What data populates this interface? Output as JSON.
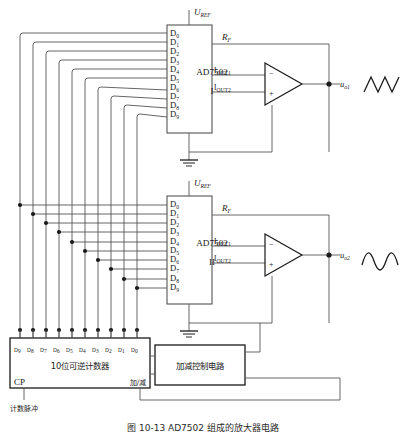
{
  "figure": {
    "caption": "图 10-13  AD7502 组成的放大器电路",
    "background": "#ffffff",
    "line_color": "#555555",
    "text_color": "#1a1a1a"
  },
  "dac1": {
    "chip_label": "AD7502",
    "unit_label": "I",
    "vref_label": "U",
    "vref_sub": "REF",
    "rf_label": "R",
    "rf_sub": "F",
    "iout1": "I",
    "iout1_sub": "OUT1",
    "iout2": "I",
    "iout2_sub": "OUT2",
    "data_pins": [
      "D0",
      "D1",
      "D2",
      "D3",
      "D4",
      "D5",
      "D6",
      "D7",
      "D8",
      "D9"
    ],
    "data_pin_base": "D",
    "data_pin_subs": [
      "0",
      "1",
      "2",
      "3",
      "4",
      "5",
      "6",
      "7",
      "8",
      "9"
    ],
    "output_label": "u",
    "output_sub": "o1",
    "output_waveform": "triangle",
    "opamp_minus": "−",
    "opamp_plus": "+"
  },
  "dac2": {
    "chip_label": "AD7502",
    "unit_label": "II",
    "vref_label": "U",
    "vref_sub": "REF",
    "rf_label": "R",
    "rf_sub": "F",
    "iout1": "I",
    "iout1_sub": "OUT1",
    "iout2": "I",
    "iout2_sub": "OUT2",
    "data_pins": [
      "D0",
      "D1",
      "D2",
      "D3",
      "D4",
      "D5",
      "D6",
      "D7",
      "D8",
      "D9"
    ],
    "data_pin_base": "D",
    "data_pin_subs": [
      "0",
      "1",
      "2",
      "3",
      "4",
      "5",
      "6",
      "7",
      "8",
      "9"
    ],
    "output_label": "u",
    "output_sub": "o2",
    "output_waveform": "sine",
    "opamp_minus": "−",
    "opamp_plus": "+"
  },
  "counter": {
    "title": "10位可逆计数器",
    "clock_label": "CP",
    "mode_label": "加/减",
    "pulse_label": "计数脉冲",
    "pin_base": "D",
    "pin_subs": [
      "9",
      "8",
      "7",
      "6",
      "5",
      "4",
      "3",
      "2",
      "1",
      "0"
    ]
  },
  "control_block": {
    "label": "加减控制电路"
  },
  "icons": {
    "ground": "ground-icon",
    "junction": "junction-dot",
    "opamp": "opamp-triangle"
  }
}
